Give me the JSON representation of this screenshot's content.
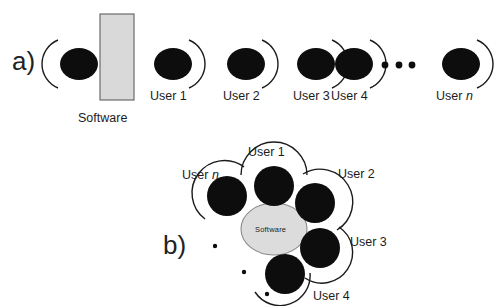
{
  "figure": {
    "background_color": "#ffffff",
    "ink_color": "#151515",
    "software_fill": "#d9d9d9",
    "software_stroke": "#6b6b6b"
  },
  "panel_a": {
    "label": "a)",
    "label_pos": {
      "x": 12,
      "y": 48
    },
    "software": {
      "name": "Software",
      "label": "Software",
      "shape": "rectangle",
      "rect": {
        "x": 100,
        "y": 14,
        "w": 34,
        "h": 86
      },
      "label_pos": {
        "x": 78,
        "y": 112
      }
    },
    "ellipse_rx": 19,
    "ellipse_ry": 16,
    "actors": [
      {
        "id": "software-actor",
        "label": "",
        "cx": 79,
        "cy": 64,
        "arc_side": "left"
      },
      {
        "id": "user-1",
        "label": "User 1",
        "cx": 173,
        "cy": 64,
        "arc_side": "right",
        "label_pos": {
          "x": 150,
          "y": 90
        }
      },
      {
        "id": "user-2",
        "label": "User 2",
        "cx": 246,
        "cy": 64,
        "arc_side": "right",
        "label_pos": {
          "x": 223,
          "y": 90
        }
      },
      {
        "id": "user-3",
        "label": "User 3",
        "cx": 316,
        "cy": 64,
        "arc_side": "right",
        "label_pos": {
          "x": 293,
          "y": 90
        }
      },
      {
        "id": "user-4",
        "label": "User 4",
        "cx": 354,
        "cy": 64,
        "arc_side": "right",
        "label_pos": {
          "x": 331,
          "y": 90
        }
      },
      {
        "id": "user-n",
        "label": "User n",
        "label_italic_tail": "n",
        "cx": 461,
        "cy": 64,
        "arc_side": "right",
        "label_pos": {
          "x": 436,
          "y": 90
        }
      }
    ],
    "ellipsis_dots": [
      {
        "cx": 385,
        "cy": 65,
        "r": 3.4
      },
      {
        "cx": 399,
        "cy": 65,
        "r": 3.4
      },
      {
        "cx": 412,
        "cy": 65,
        "r": 3.4
      }
    ]
  },
  "panel_b": {
    "label": "b)",
    "label_pos": {
      "x": 163,
      "y": 232
    },
    "software": {
      "name": "Software",
      "label": "Software",
      "shape": "ellipse",
      "cx": 274,
      "cy": 229,
      "rx": 33,
      "ry": 26
    },
    "user_radius": 20,
    "actors": [
      {
        "id": "user-1",
        "label": "User 1",
        "cx": 274,
        "cy": 186,
        "angle": -90,
        "label_pos": {
          "x": 248,
          "y": 146
        }
      },
      {
        "id": "user-2",
        "label": "User 2",
        "cx": 315,
        "cy": 203,
        "angle": -30,
        "label_pos": {
          "x": 338,
          "y": 168
        }
      },
      {
        "id": "user-3",
        "label": "User 3",
        "cx": 320,
        "cy": 248,
        "angle": 30,
        "label_pos": {
          "x": 350,
          "y": 236
        }
      },
      {
        "id": "user-4",
        "label": "User 4",
        "cx": 285,
        "cy": 274,
        "angle": 80,
        "label_pos": {
          "x": 313,
          "y": 292
        }
      },
      {
        "id": "user-n",
        "label": "User n",
        "label_italic_tail": "n",
        "cx": 227,
        "cy": 196,
        "angle": -145,
        "label_pos": {
          "x": 182,
          "y": 169
        }
      }
    ],
    "ellipsis_dots": [
      {
        "cx": 215,
        "cy": 246,
        "r": 2.2
      },
      {
        "cx": 244,
        "cy": 272,
        "r": 2.2
      },
      {
        "cx": 267,
        "cy": 294,
        "r": 2.2
      }
    ]
  }
}
